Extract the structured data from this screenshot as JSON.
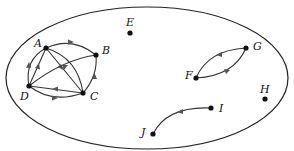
{
  "diagram": {
    "type": "directed-graph",
    "boundary": {
      "shape": "ellipse",
      "cx": 147,
      "cy": 78,
      "rx": 141,
      "ry": 71
    },
    "nodes": [
      {
        "id": "A",
        "label": "A",
        "x": 46,
        "y": 48,
        "lx": 34,
        "ly": 47
      },
      {
        "id": "B",
        "label": "B",
        "x": 96,
        "y": 55,
        "lx": 102,
        "ly": 54
      },
      {
        "id": "C",
        "label": "C",
        "x": 83,
        "y": 93,
        "lx": 90,
        "ly": 100
      },
      {
        "id": "D",
        "label": "D",
        "x": 29,
        "y": 86,
        "lx": 20,
        "ly": 100
      },
      {
        "id": "E",
        "label": "E",
        "x": 130,
        "y": 33,
        "lx": 126,
        "ly": 26
      },
      {
        "id": "F",
        "label": "F",
        "x": 196,
        "y": 78,
        "lx": 185,
        "ly": 79
      },
      {
        "id": "G",
        "label": "G",
        "x": 246,
        "y": 48,
        "lx": 253,
        "ly": 50
      },
      {
        "id": "H",
        "label": "H",
        "x": 265,
        "y": 99,
        "lx": 260,
        "ly": 93
      },
      {
        "id": "I",
        "label": "I",
        "x": 211,
        "y": 108,
        "lx": 219,
        "ly": 112
      },
      {
        "id": "J",
        "label": "J",
        "x": 153,
        "y": 134,
        "lx": 141,
        "ly": 136
      }
    ],
    "edges": [
      {
        "from": "A",
        "to": "B"
      },
      {
        "from": "D",
        "to": "A"
      },
      {
        "from": "D",
        "to": "A"
      },
      {
        "from": "A",
        "to": "C"
      },
      {
        "from": "A",
        "to": "C"
      },
      {
        "from": "D",
        "to": "B"
      },
      {
        "from": "C",
        "to": "D"
      },
      {
        "from": "D",
        "to": "C"
      },
      {
        "from": "C",
        "to": "B"
      },
      {
        "from": "G",
        "to": "F"
      },
      {
        "from": "F",
        "to": "G"
      },
      {
        "from": "I",
        "to": "J"
      }
    ],
    "isolated_nodes": [
      "E",
      "H"
    ]
  }
}
